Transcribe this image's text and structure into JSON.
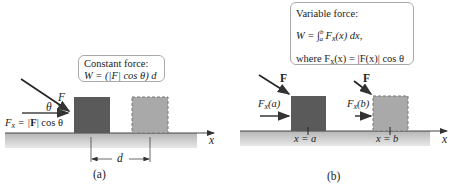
{
  "panel_a": {
    "caption": "(a)",
    "box": {
      "title": "Constant force:",
      "formula": "W = (|F| cos θ) d"
    },
    "labels": {
      "force": "F",
      "angle": "θ",
      "component_lhs": "F",
      "component_sub": "x",
      "component_rhs_bold": "F",
      "component_rhs_tail": "| cos θ",
      "distance": "d",
      "axis": "x"
    }
  },
  "panel_b": {
    "caption": "(b)",
    "box": {
      "title": "Variable force:",
      "formula_line1_prefix": "W = ∫",
      "lower_limit": "a",
      "upper_limit": "b",
      "formula_line1_suffix": "F",
      "formula_line1_sub": "x",
      "formula_line1_end": "(x) dx,",
      "formula_line2": "where F",
      "formula_line2_sub": "x",
      "formula_line2_end": "(x) = |F(x)| cos θ"
    },
    "labels": {
      "force_left": "F",
      "force_right": "F",
      "comp_a_main": "F",
      "comp_a_sub": "x",
      "comp_a_arg": "(a)",
      "comp_b_main": "F",
      "comp_b_sub": "x",
      "comp_b_arg": "(b)",
      "pos_a": "x = a",
      "pos_b": "x = b",
      "axis": "x"
    }
  },
  "colors": {
    "ground": "#b9b9b9",
    "block_initial": "#5a5a5a",
    "block_final": "#a8a8a8",
    "arrow": "#333333"
  }
}
